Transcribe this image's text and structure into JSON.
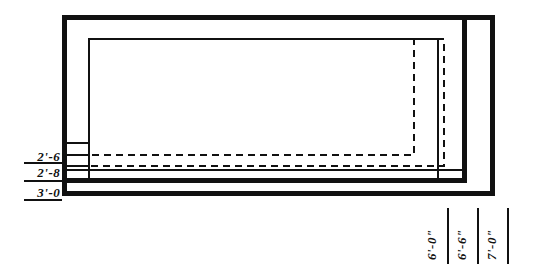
{
  "figure": {
    "kind": "architectural-plan-drawing",
    "ink_color": "#111111",
    "background_color": "#ffffff"
  },
  "dimensions": {
    "vertical": [
      {
        "id": "2-6",
        "label": "2'-6\""
      },
      {
        "id": "2-8",
        "label": "2'-8\""
      },
      {
        "id": "3-0",
        "label": "3'-0\""
      }
    ],
    "horizontal": [
      {
        "id": "6-0",
        "label": "6'-0\""
      },
      {
        "id": "6-6",
        "label": "6'-6\""
      },
      {
        "id": "7-0",
        "label": "7'-0\""
      }
    ]
  },
  "outlines": {
    "outer_solid": {
      "x": 62,
      "y": 15,
      "w": 432,
      "h": 180,
      "stroke": 5
    },
    "second_solid": {
      "x": 62,
      "y": 15,
      "w": 404,
      "h": 166,
      "stroke": 5
    },
    "inner_solid": {
      "x": 88,
      "y": 38,
      "w": 350,
      "h": 144,
      "stroke": 2
    },
    "dashed_large": {
      "x": 88,
      "y": 38,
      "w": 356,
      "h": 128,
      "stroke": 2
    },
    "dashed_small": {
      "x": 88,
      "y": 38,
      "w": 326,
      "h": 117,
      "stroke": 2
    }
  }
}
